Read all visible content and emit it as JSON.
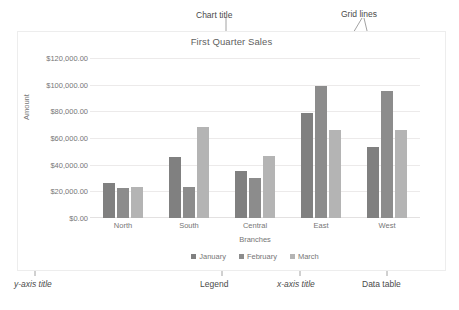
{
  "chart_data": {
    "type": "bar",
    "title": "First Quarter Sales",
    "xlabel": "Branches",
    "ylabel": "Amount",
    "categories": [
      "North",
      "South",
      "Central",
      "East",
      "West"
    ],
    "series": [
      {
        "name": "January",
        "color": "#808080",
        "values": [
          26500,
          45500,
          35000,
          78500,
          53500
        ]
      },
      {
        "name": "February",
        "color": "#8c8c8c",
        "values": [
          22500,
          23500,
          30000,
          99000,
          95000
        ]
      },
      {
        "name": "March",
        "color": "#b4b4b4",
        "values": [
          23000,
          68000,
          46500,
          66000,
          66000
        ]
      }
    ],
    "ylim": [
      0,
      120000
    ],
    "ytick_values": [
      0,
      20000,
      40000,
      60000,
      80000,
      100000,
      120000
    ],
    "ytick_labels": [
      "$0.00",
      "$20,000.00",
      "$40,000.00",
      "$60,000.00",
      "$80,000.00",
      "$100,000.00",
      "$120,000.00"
    ],
    "grid": true,
    "legend_position": "bottom"
  },
  "annotations": {
    "chart_title": "Chart title",
    "grid_lines": "Grid lines",
    "y_axis_title": "y-axis title",
    "legend": "Legend",
    "x_axis_title": "x-axis title",
    "data_table": "Data table"
  }
}
